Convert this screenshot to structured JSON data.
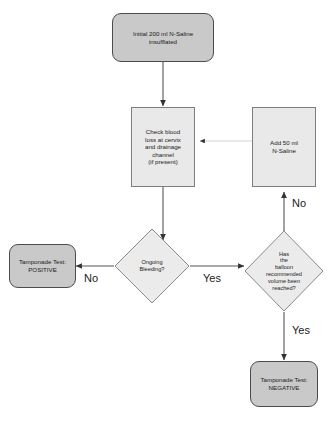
{
  "diagram": {
    "colors": {
      "terminator_fill": "#c9c9c9",
      "process_fill": "#e9e9e9",
      "decision_fill": "#ebebeb",
      "stroke": "#4c4c4c",
      "text": "#1a1a1a",
      "background": "#ffffff"
    },
    "nodes": [
      {
        "id": "start",
        "shape": "rounded-rectangle",
        "text": "Initial 200 ml N-Saline\ninsufflated"
      },
      {
        "id": "check",
        "shape": "rectangle",
        "text": "Check blood\nloss at cervix\nand drainage\nchannel\n(if present)"
      },
      {
        "id": "add",
        "shape": "rectangle",
        "text": "Add 50 ml\nN-Saline"
      },
      {
        "id": "positive",
        "shape": "rounded-rectangle",
        "text": "Tamponade Test:\nPOSITIVE"
      },
      {
        "id": "bleeding",
        "shape": "diamond",
        "text": "Ongoing\nBleeding?"
      },
      {
        "id": "volume",
        "shape": "diamond",
        "text": "Has\nthe\nballoon\nrecommended\nvolume been\nreached?"
      },
      {
        "id": "negative",
        "shape": "rounded-rectangle",
        "text": "Tamponade Test:\nNEGATIVE"
      }
    ],
    "edge_labels": {
      "bleeding_no": "No",
      "bleeding_yes": "Yes",
      "volume_no": "No",
      "volume_yes": "Yes"
    }
  }
}
